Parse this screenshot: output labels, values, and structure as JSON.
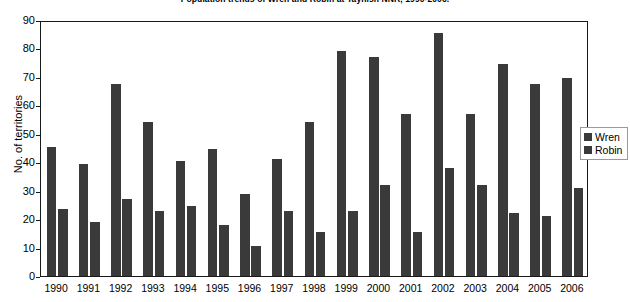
{
  "chart_data": {
    "type": "bar",
    "title": "Population trends of Wren and Robin at Taynish NNR, 1990-2006.",
    "xlabel": "",
    "ylabel": "No. of territories",
    "ylim": [
      0,
      90
    ],
    "ytick_step": 10,
    "yticks": [
      0,
      10,
      20,
      30,
      40,
      50,
      60,
      70,
      80,
      90
    ],
    "grid": false,
    "legend_position": "right",
    "bar_color": "#3a3a3a",
    "frame_color": "#1a1a1a",
    "categories": [
      "1990",
      "1991",
      "1992",
      "1993",
      "1994",
      "1995",
      "1996",
      "1997",
      "1998",
      "1999",
      "2000",
      "2001",
      "2002",
      "2003",
      "2004",
      "2005",
      "2006"
    ],
    "series": [
      {
        "name": "Wren",
        "values": [
          45.5,
          39.5,
          67.5,
          54,
          40.5,
          44.5,
          29,
          41,
          54,
          79,
          77,
          57,
          85.5,
          57,
          74.5,
          67.5,
          69.5
        ]
      },
      {
        "name": "Robin",
        "values": [
          23.5,
          19,
          27,
          23,
          24.5,
          18,
          10.5,
          23,
          15.5,
          23,
          32,
          15.5,
          38,
          32,
          22,
          21,
          31
        ]
      }
    ]
  },
  "legend": {
    "items": [
      {
        "label": "Wren"
      },
      {
        "label": "Robin"
      }
    ]
  }
}
